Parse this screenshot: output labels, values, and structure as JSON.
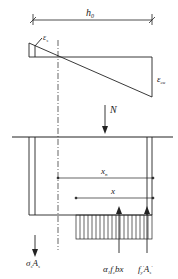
{
  "diagram": {
    "labels": {
      "h0": "h",
      "h0_sub": "0",
      "eps_s": "ε",
      "eps_s_sub": "s",
      "eps_cu": "ε",
      "eps_cu_sub": "cu",
      "N": "N",
      "xn": "x",
      "xn_sub": "n",
      "x": "x",
      "sigma_s_As": "σ",
      "sigma_s_As_sub": "s",
      "sigma_s_As_tail": "A",
      "sigma_s_As_tail_sub": "s",
      "concrete_force": "α",
      "concrete_force_sub1": "1",
      "concrete_force_mid": "f",
      "concrete_force_sub2": "c",
      "concrete_force_tail": "bx",
      "steel_force": "f",
      "steel_force_sub": "y",
      "steel_force_sup": "′",
      "steel_force_tail": "A",
      "steel_force_tail_sub": "s",
      "steel_force_tail_sup": "′"
    },
    "colors": {
      "line": "#222222",
      "background": "#ffffff"
    }
  }
}
